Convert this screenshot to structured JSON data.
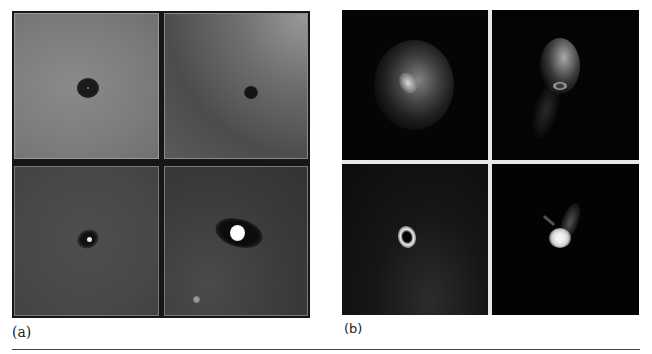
{
  "figure": {
    "panels": [
      {
        "id": "a",
        "label": "(a)",
        "tiles": [
          {
            "position": "top-left",
            "description": "grey field with dark round spot"
          },
          {
            "position": "top-right",
            "description": "grey mottled field with small dark spot"
          },
          {
            "position": "bottom-left",
            "description": "dark grey field with dark halo and tiny bright dot"
          },
          {
            "position": "bottom-right",
            "description": "dark field with dark elliptical halo around bright core, small faint spot lower left"
          }
        ]
      },
      {
        "id": "b",
        "label": "(b)",
        "tiles": [
          {
            "position": "top-left",
            "description": "diffuse fluorescent cell on black"
          },
          {
            "position": "top-right",
            "description": "compact fluorescent cell with tail on black"
          },
          {
            "position": "bottom-left",
            "description": "bright ring-shaped object on dark noisy background"
          },
          {
            "position": "bottom-right",
            "description": "bright round body with faint tail on black"
          }
        ]
      }
    ],
    "colors": {
      "background": "#ffffff",
      "panel_a_frame": "#161616",
      "panel_b_frame": "#e8e8e8",
      "rule": "#444444"
    }
  }
}
